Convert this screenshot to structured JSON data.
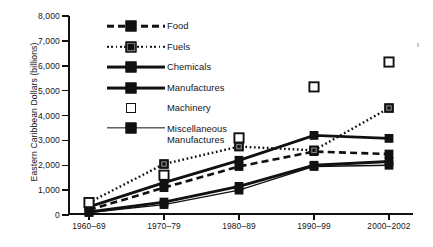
{
  "chart_data": {
    "type": "line",
    "title": "",
    "xlabel": "",
    "ylabel": "Eastern Caribbean Dollars (billions)",
    "categories": [
      "1960–69",
      "1970–79",
      "1980–89",
      "1990–99",
      "2000–2002"
    ],
    "ylim": [
      0,
      8000
    ],
    "yticks": [
      0,
      1000,
      2000,
      3000,
      4000,
      5000,
      6000,
      7000,
      8000
    ],
    "ytick_labels": [
      "0",
      "1,000",
      "2,000",
      "3,000",
      "4,000",
      "5,000",
      "6,000",
      "7,000",
      "8,000"
    ],
    "grid": false,
    "legend_position": "upper-left-inside",
    "series": [
      {
        "name": "Food",
        "style": "dashed",
        "marker": "filled-square",
        "values": [
          200,
          1100,
          1950,
          2550,
          2450
        ]
      },
      {
        "name": "Fuels",
        "style": "dotted",
        "marker": "hatched-square",
        "values": [
          500,
          2050,
          2750,
          2600,
          4300
        ]
      },
      {
        "name": "Chemicals",
        "style": "solid",
        "marker": "filled-square",
        "values": [
          330,
          1300,
          2200,
          3200,
          3080
        ]
      },
      {
        "name": "Manufactures",
        "style": "solid",
        "marker": "filled-square",
        "values": [
          120,
          520,
          1150,
          2000,
          2150
        ]
      },
      {
        "name": "Machinery",
        "style": "none",
        "marker": "open-square",
        "values": [
          500,
          1600,
          3100,
          5150,
          6150
        ]
      },
      {
        "name": "Miscellaneous Manufactures",
        "style": "thin",
        "marker": "filled-square",
        "values": [
          100,
          420,
          1000,
          1950,
          2000
        ]
      }
    ]
  },
  "legend": {
    "items": [
      {
        "label": "Food",
        "label2": ""
      },
      {
        "label": "Fuels",
        "label2": ""
      },
      {
        "label": "Chemicals",
        "label2": ""
      },
      {
        "label": "Manufactures",
        "label2": ""
      },
      {
        "label": "Machinery",
        "label2": ""
      },
      {
        "label": "Miscellaneous",
        "label2": "Manufactures"
      }
    ]
  },
  "colors": {
    "ink": "#111111",
    "background": "#ffffff"
  }
}
